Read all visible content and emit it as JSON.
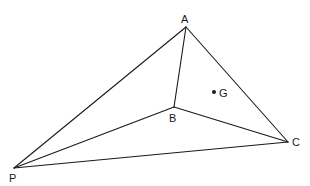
{
  "diagram": {
    "type": "geometry-figure",
    "points": {
      "A": {
        "label": "A",
        "x": 186,
        "y": 27,
        "label_x": 181,
        "label_y": 23
      },
      "B": {
        "label": "B",
        "x": 174,
        "y": 107,
        "label_x": 169,
        "label_y": 122
      },
      "C": {
        "label": "C",
        "x": 288,
        "y": 142,
        "label_x": 292,
        "label_y": 146
      },
      "P": {
        "label": "P",
        "x": 14,
        "y": 168,
        "label_x": 9,
        "label_y": 182
      },
      "G": {
        "label": "G",
        "x": 214,
        "y": 92,
        "label_x": 219,
        "label_y": 97
      }
    },
    "edges": [
      [
        "P",
        "A"
      ],
      [
        "P",
        "B"
      ],
      [
        "P",
        "C"
      ],
      [
        "A",
        "B"
      ],
      [
        "A",
        "C"
      ],
      [
        "B",
        "C"
      ]
    ],
    "marked_points": [
      "G"
    ],
    "colors": {
      "line": "#1a1a1a",
      "background": "#ffffff"
    }
  }
}
